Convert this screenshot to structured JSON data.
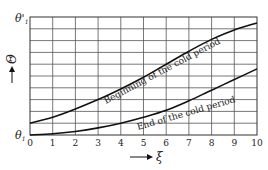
{
  "chart_data": {
    "type": "line",
    "title": "",
    "xlabel": "ξ",
    "ylabel": "Θ",
    "x_ticks": [
      "0",
      "1",
      "2",
      "3",
      "4",
      "5",
      "6",
      "7",
      "8",
      "9",
      "10"
    ],
    "y_tick_labels": {
      "top": "θ'₁",
      "bottom": "θ₁"
    },
    "xlim": [
      0,
      10
    ],
    "ylim": [
      0,
      1
    ],
    "grid": true,
    "grid_rows": 10,
    "grid_cols": 10,
    "series": [
      {
        "name": "Beginning of the cold period",
        "x": [
          0,
          1,
          2,
          3,
          4,
          5,
          6,
          7,
          8,
          9,
          10
        ],
        "y": [
          0.1,
          0.15,
          0.22,
          0.3,
          0.39,
          0.49,
          0.6,
          0.71,
          0.81,
          0.89,
          0.95
        ]
      },
      {
        "name": "End of the cold period",
        "x": [
          0,
          1,
          2,
          3,
          4,
          5,
          6,
          7,
          8,
          9,
          10
        ],
        "y": [
          0.0,
          0.01,
          0.03,
          0.06,
          0.1,
          0.15,
          0.21,
          0.29,
          0.38,
          0.47,
          0.56
        ]
      }
    ]
  },
  "labels": {
    "y_top": "θ'",
    "y_top_sub": "1",
    "y_bottom": "θ",
    "y_bottom_sub": "1",
    "y_axis": "Θ",
    "x_axis": "ξ",
    "curve1": "Beginning of the cold period",
    "curve2": "End of the cold period"
  }
}
